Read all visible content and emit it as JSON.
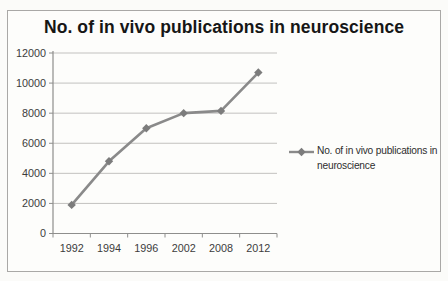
{
  "chart_data": {
    "type": "line",
    "title": "No. of in vivo publications in neuroscience",
    "categories": [
      "1992",
      "1994",
      "1996",
      "2002",
      "2008",
      "2012"
    ],
    "series": [
      {
        "name": "No. of in vivo publications in neuroscience",
        "values": [
          1900,
          4800,
          7000,
          8000,
          8150,
          10700
        ]
      }
    ],
    "xlabel": "",
    "ylabel": "",
    "ylim": [
      0,
      12000
    ],
    "y_ticks": [
      0,
      2000,
      4000,
      6000,
      8000,
      10000,
      12000
    ],
    "grid": "horizontal",
    "legend_position": "right",
    "marker": "diamond",
    "line_color": "#8a8a8a",
    "marker_color": "#7c7c7c"
  },
  "legend": {
    "lines": [
      "No. of in vivo publications in",
      "neuroscience"
    ]
  },
  "colors": {
    "frame_border": "#a9a8a6",
    "gridline": "#c2c1bf",
    "axis": "#8e8e8c",
    "series_line": "#8a8a8a",
    "marker_fill": "#7c7c7c",
    "title_text": "#161616",
    "tick_text": "#3c3c3c"
  }
}
